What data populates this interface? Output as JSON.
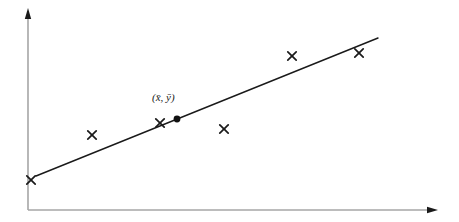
{
  "figure": {
    "background_color": "#ffffff",
    "width": 459,
    "height": 222
  },
  "axes": {
    "color": "#a6a6a6",
    "arrow_color": "#1a1a1a",
    "x_axis": {
      "name": "x-axis",
      "x_start": 28,
      "x_end": 432,
      "y": 210,
      "has_arrow": true,
      "label": "",
      "ticks": []
    },
    "y_axis": {
      "name": "y-axis",
      "x": 28,
      "y_start": 210,
      "y_end": 14,
      "has_arrow": true,
      "label": "",
      "ticks": []
    }
  },
  "annotations": {
    "mean_point_label": "(x̄, ȳ)",
    "mean_point_label_x": 152,
    "mean_point_label_y": 92
  },
  "chart_data": {
    "type": "scatter",
    "title": "",
    "xlabel": "",
    "ylabel": "",
    "grid": false,
    "legend": null,
    "xlim": [
      28,
      432
    ],
    "ylim": [
      14,
      210
    ],
    "marker_symbol": "x",
    "marker_color": "#1a1a1a",
    "points": [
      {
        "name": "point-1",
        "x": 31,
        "y": 180
      },
      {
        "name": "point-2",
        "x": 92,
        "y": 135
      },
      {
        "name": "point-3",
        "x": 160,
        "y": 123
      },
      {
        "name": "point-4",
        "x": 224,
        "y": 129
      },
      {
        "name": "point-5",
        "x": 292,
        "y": 56
      },
      {
        "name": "point-6",
        "x": 359,
        "y": 53
      }
    ],
    "mean_point": {
      "name": "mean-point",
      "x": 177,
      "y": 119,
      "marker_symbol": "filled-circle",
      "radius": 3.4,
      "color": "#111111",
      "label": "(x̄, ȳ)"
    },
    "fit_line": {
      "name": "line-of-best-fit",
      "x1": 36,
      "y1": 176,
      "x2": 378,
      "y2": 38,
      "color": "#1a1a1a",
      "width": 1.4
    }
  }
}
